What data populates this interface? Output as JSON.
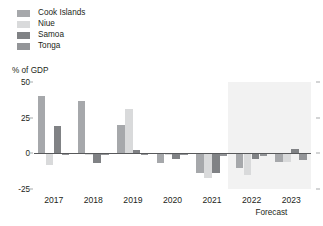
{
  "legend": {
    "items": [
      {
        "label": "Cook Islands",
        "color": "#a6a8ab"
      },
      {
        "label": "Niue",
        "color": "#d9dadb"
      },
      {
        "label": "Samoa",
        "color": "#808285"
      },
      {
        "label": "Tonga",
        "color": "#939598"
      }
    ]
  },
  "axis_title": "% of GDP",
  "forecast_note": "Forecast",
  "chart_data": {
    "type": "bar",
    "title": "",
    "xlabel": "",
    "ylabel": "% of GDP",
    "ylim": [
      -25,
      50
    ],
    "yticks": [
      -25,
      0,
      25,
      50
    ],
    "ytick_labels": [
      "-25",
      "0",
      "25",
      "50"
    ],
    "grid": false,
    "legend_position": "top-left",
    "categories": [
      "2017",
      "2018",
      "2019",
      "2020",
      "2021",
      "2022",
      "2023"
    ],
    "series": [
      {
        "name": "Cook Islands",
        "color": "#a6a8ab",
        "values": [
          40,
          37,
          20,
          -7,
          -14,
          -10,
          -6
        ]
      },
      {
        "name": "Niue",
        "color": "#d9dadb",
        "values": [
          -8,
          -1,
          31,
          -1,
          -17,
          -15,
          -6
        ]
      },
      {
        "name": "Samoa",
        "color": "#808285",
        "values": [
          19,
          -7,
          2,
          -4,
          -14,
          -4,
          3
        ]
      },
      {
        "name": "Tonga",
        "color": "#939598",
        "values": [
          -1,
          -1,
          -1,
          -1,
          -2,
          -2,
          -5
        ]
      }
    ],
    "annotations": [
      {
        "text": "Forecast",
        "span": [
          "2022",
          "2023"
        ],
        "type": "shaded-band"
      }
    ]
  }
}
